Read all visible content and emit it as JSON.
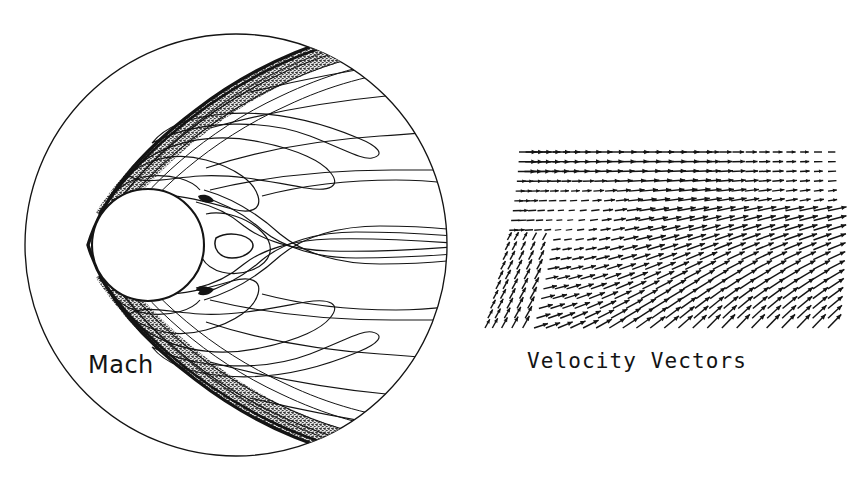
{
  "figure": {
    "background_color": "#ffffff",
    "ink_color": "#141414",
    "width": 858,
    "height": 485
  },
  "panels": [
    {
      "id": "mach-panel",
      "caption": "Mach",
      "caption_position": "lower-left",
      "kind": "contour"
    },
    {
      "id": "vector-panel",
      "caption": "Velocity  Vectors",
      "caption_position": "below",
      "kind": "quiver"
    }
  ],
  "chart_data": [
    {
      "type": "contour",
      "title": "Mach",
      "xlabel": "",
      "ylabel": "",
      "grid": false,
      "legend": "none",
      "domain_shape": "circle",
      "domain": {
        "center_x": 236,
        "center_y": 245,
        "radius": 212,
        "note": "outer computational far-field boundary, thin solid circle"
      },
      "body": {
        "shape": "circle",
        "center_x": 148,
        "center_y": 245,
        "radius": 56,
        "note": "blunt sphere cross-section, flow from left to right"
      },
      "bow_shock": {
        "type": "detached-bow-shock",
        "stand_off_x": 80,
        "stand_off_distance": 12,
        "note": "thick dark contour bundle hugging the windward side, opening downstream into two stippled shock-layer wedges"
      },
      "contour_levels": [
        0.2,
        0.4,
        0.6,
        0.8,
        1.0,
        1.2,
        1.4,
        1.6,
        1.8,
        2.0,
        2.4,
        2.8,
        3.2,
        3.6,
        4.0
      ],
      "features": [
        "sonic line wrapping the sphere shoulder",
        "subsonic stagnation region ahead of the body",
        "closed triangular recirculation contour in the near wake",
        "wake shear layers converging downstream",
        "dense stippled contour bundle inside the shock layer"
      ]
    },
    {
      "type": "quiver",
      "title": "Velocity  Vectors",
      "xlabel": "",
      "ylabel": "",
      "grid": false,
      "legend": "none",
      "glyph": "arrow",
      "grid_columns": 27,
      "grid_rows": 19,
      "field": {
        "x_min": 497,
        "x_max": 828,
        "y_min": 152,
        "y_max": 328,
        "note": "half-plane body-fitted mesh; vectors turn from axial at the top to up-and-right in the expansion fan"
      },
      "features": [
        "near-horizontal long vectors along the top freestream row",
        "vector length decreasing toward the body surface (boundary layer)",
        "vectors fanning outward and upward around the shoulder",
        "very short vectors in the low-speed pocket near the wall",
        "progressive turning toward 30-45 degrees in the lower-right region"
      ]
    }
  ],
  "labels": {
    "mach": "Mach",
    "velocity_vectors": "Velocity  Vectors"
  }
}
